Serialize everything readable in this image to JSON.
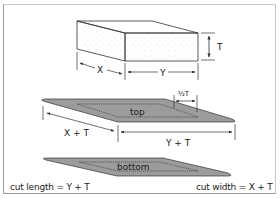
{
  "figure": {
    "block": {
      "dimension_labels": {
        "x": "X",
        "y": "Y",
        "t": "T"
      }
    },
    "top_panel": {
      "label": "top",
      "inset_label": "½T",
      "length_label": "X + T",
      "width_label": "Y + T"
    },
    "bottom_panel": {
      "label": "bottom"
    },
    "formulas": {
      "cut_length": "cut length = Y + T",
      "cut_width": "cut width = X + T"
    },
    "colors": {
      "panel_fill": "#9c9c9c",
      "stroke": "#333333",
      "frame": "#9a9a9a"
    }
  }
}
